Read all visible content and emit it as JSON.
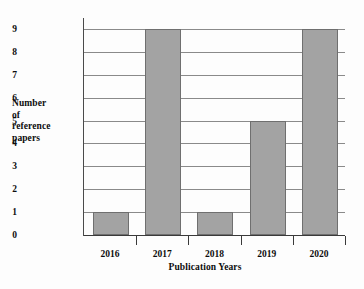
{
  "chart_data": {
    "type": "bar",
    "title": "",
    "categories": [
      "2016",
      "2017",
      "2018",
      "2019",
      "2020"
    ],
    "values": [
      1,
      9,
      1,
      5,
      9
    ],
    "series": [
      {
        "name": "Number of reference papers",
        "values": [
          1,
          9,
          1,
          5,
          9
        ]
      }
    ],
    "xlabel": "Publication Years",
    "ylabel": "Number of reference papers",
    "ylabel_lines": [
      "Number",
      "of",
      "reference",
      "papers"
    ],
    "ylim": [
      0,
      9
    ],
    "yticks": [
      "9",
      "8",
      "7",
      "6",
      "5",
      "4",
      "3",
      "2",
      "1",
      "0"
    ],
    "grid": true,
    "legend": "none",
    "colors": {
      "bar_fill": "#a3a3a3",
      "bar_edge": "#6f6f6f",
      "gridline": "#8a8a8a",
      "axis": "#3a3a3a",
      "text": "#0d0d0d",
      "background": "#fdfdfd"
    }
  }
}
